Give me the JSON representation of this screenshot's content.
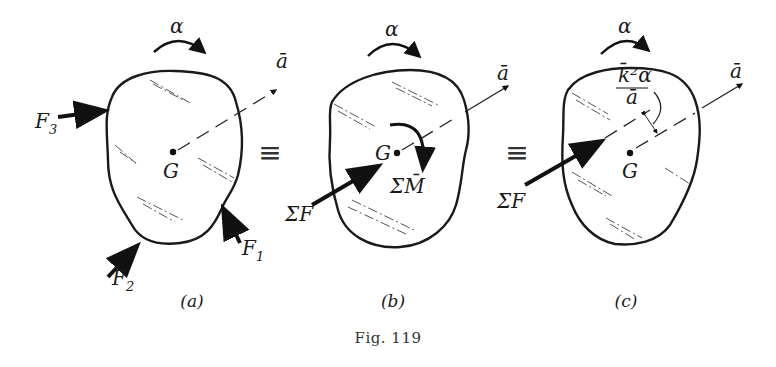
{
  "figure": {
    "caption": "Fig. 119",
    "equivalence_symbol": "≡",
    "panels": [
      {
        "id": "a",
        "label": "(a)",
        "angular_accel": "α",
        "center": "G",
        "accel_vector": "ā",
        "forces": [
          "F1",
          "F2",
          "F3"
        ],
        "force_labels": {
          "F1": {
            "main": "F",
            "sub": "1"
          },
          "F2": {
            "main": "F",
            "sub": "2"
          },
          "F3": {
            "main": "F",
            "sub": "3"
          }
        }
      },
      {
        "id": "b",
        "label": "(b)",
        "angular_accel": "α",
        "center": "G",
        "accel_vector": "ā",
        "resultant_force": "ΣF",
        "resultant_moment": "ΣM̄"
      },
      {
        "id": "c",
        "label": "(c)",
        "angular_accel": "α",
        "center": "G",
        "accel_vector": "ā",
        "resultant_force": "ΣF",
        "offset_numerator": "k̄²α",
        "offset_denominator": "ā"
      }
    ]
  }
}
